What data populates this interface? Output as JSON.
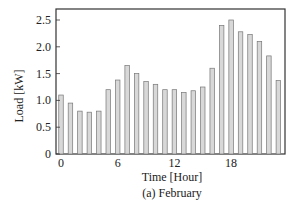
{
  "chart_data": {
    "type": "bar",
    "title": "",
    "caption": "(a) February",
    "xlabel": "Time [Hour]",
    "ylabel": "Load [kW]",
    "categories": [
      0,
      1,
      2,
      3,
      4,
      5,
      6,
      7,
      8,
      9,
      10,
      11,
      12,
      13,
      14,
      15,
      16,
      17,
      18,
      19,
      20,
      21,
      22,
      23
    ],
    "values": [
      1.1,
      0.95,
      0.8,
      0.78,
      0.8,
      1.2,
      1.38,
      1.65,
      1.5,
      1.35,
      1.3,
      1.2,
      1.2,
      1.15,
      1.18,
      1.25,
      1.6,
      2.4,
      2.5,
      2.28,
      2.23,
      2.1,
      1.83,
      1.37
    ],
    "ylim": [
      0,
      2.7
    ],
    "yticks": [
      0,
      0.5,
      1.0,
      1.5,
      2.0,
      2.5
    ],
    "ytick_labels": [
      "0",
      "0.5",
      "1.0",
      "1.5",
      "2.0",
      "2.5"
    ],
    "xticks": [
      0,
      6,
      12,
      18
    ],
    "xtick_labels": [
      "0",
      "6",
      "12",
      "18"
    ],
    "grid": false,
    "legend": null,
    "colors": {
      "bar_fill": "#d8d8d8",
      "bar_stroke": "#777777",
      "axis": "#333333"
    }
  }
}
